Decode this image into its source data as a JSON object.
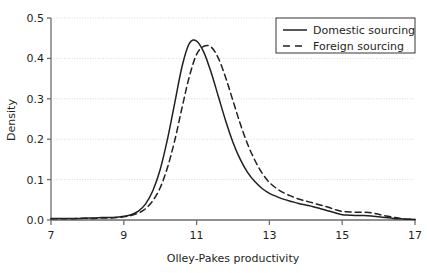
{
  "chart_data": {
    "type": "line",
    "title": "",
    "subtitle": "",
    "xlabel": "Olley-Pakes productivity",
    "ylabel": "Density",
    "xlim": [
      7,
      17
    ],
    "ylim": [
      0.0,
      0.5
    ],
    "xticks": [
      "7",
      "9",
      "11",
      "13",
      "15",
      "17"
    ],
    "xtick_values": [
      7,
      9,
      11,
      13,
      15,
      17
    ],
    "yticks": [
      "0.0",
      "0.1",
      "0.2",
      "0.3",
      "0.4",
      "0.5"
    ],
    "ytick_values": [
      0.0,
      0.1,
      0.2,
      0.3,
      0.4,
      0.5
    ],
    "grid": "horizontal-dotted",
    "legend_position": "top-right",
    "series": [
      {
        "name": "Domestic sourcing",
        "style": "solid",
        "color": "#231f20",
        "x": [
          7.0,
          7.2,
          7.4,
          7.6,
          7.8,
          8.0,
          8.2,
          8.4,
          8.6,
          8.8,
          9.0,
          9.2,
          9.4,
          9.6,
          9.8,
          10.0,
          10.2,
          10.4,
          10.6,
          10.8,
          11.0,
          11.2,
          11.4,
          11.6,
          11.8,
          12.0,
          12.2,
          12.4,
          12.6,
          12.8,
          13.0,
          13.2,
          13.4,
          13.6,
          13.8,
          14.0,
          14.2,
          14.4,
          14.6,
          14.8,
          15.0,
          15.2,
          15.4,
          15.6,
          15.8,
          16.0,
          16.2,
          16.4,
          16.6,
          16.8,
          17.0
        ],
        "y": [
          0.004,
          0.004,
          0.004,
          0.004,
          0.004,
          0.005,
          0.005,
          0.006,
          0.006,
          0.007,
          0.009,
          0.013,
          0.022,
          0.04,
          0.073,
          0.125,
          0.2,
          0.29,
          0.38,
          0.437,
          0.443,
          0.415,
          0.365,
          0.305,
          0.245,
          0.192,
          0.15,
          0.118,
          0.095,
          0.078,
          0.066,
          0.058,
          0.051,
          0.046,
          0.041,
          0.037,
          0.033,
          0.028,
          0.023,
          0.018,
          0.013,
          0.012,
          0.011,
          0.011,
          0.01,
          0.008,
          0.006,
          0.004,
          0.003,
          0.002,
          0.001
        ]
      },
      {
        "name": "Foreign sourcing",
        "style": "dashed",
        "color": "#231f20",
        "x": [
          7.0,
          7.2,
          7.4,
          7.6,
          7.8,
          8.0,
          8.2,
          8.4,
          8.6,
          8.8,
          9.0,
          9.2,
          9.4,
          9.6,
          9.8,
          10.0,
          10.2,
          10.4,
          10.6,
          10.8,
          11.0,
          11.2,
          11.4,
          11.6,
          11.8,
          12.0,
          12.2,
          12.4,
          12.6,
          12.8,
          13.0,
          13.2,
          13.4,
          13.6,
          13.8,
          14.0,
          14.2,
          14.4,
          14.6,
          14.8,
          15.0,
          15.2,
          15.4,
          15.6,
          15.8,
          16.0,
          16.2,
          16.4,
          16.6,
          16.8,
          17.0
        ],
        "y": [
          0.003,
          0.003,
          0.003,
          0.003,
          0.004,
          0.004,
          0.004,
          0.005,
          0.005,
          0.006,
          0.008,
          0.011,
          0.017,
          0.028,
          0.048,
          0.08,
          0.13,
          0.197,
          0.278,
          0.355,
          0.41,
          0.43,
          0.428,
          0.4,
          0.352,
          0.295,
          0.238,
          0.188,
          0.148,
          0.116,
          0.093,
          0.078,
          0.067,
          0.059,
          0.052,
          0.047,
          0.042,
          0.037,
          0.032,
          0.026,
          0.021,
          0.02,
          0.019,
          0.019,
          0.018,
          0.014,
          0.01,
          0.007,
          0.004,
          0.002,
          0.001
        ]
      }
    ],
    "legend": [
      {
        "label": "Domestic sourcing",
        "style": "solid"
      },
      {
        "label": "Foreign sourcing",
        "style": "dashed"
      }
    ]
  },
  "colors": {
    "ink": "#231f20",
    "axis": "#6d6e71",
    "grid": "#d9d9d9",
    "background": "#ffffff"
  }
}
